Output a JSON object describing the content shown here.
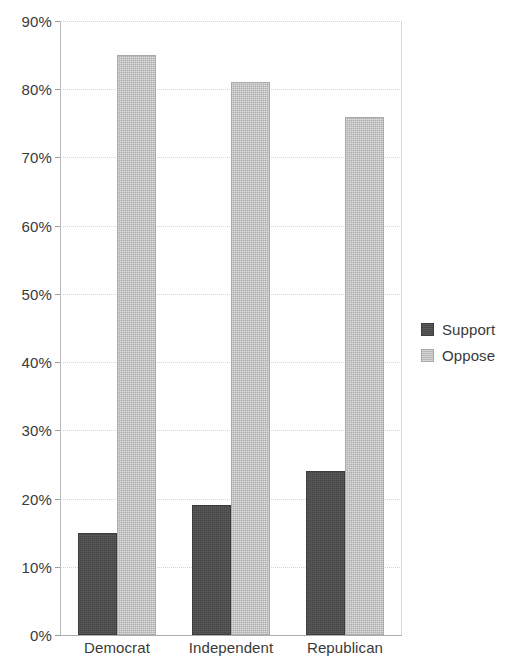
{
  "chart_data": {
    "type": "bar",
    "title": "",
    "subtitle": "",
    "xlabel": "",
    "ylabel": "",
    "categories": [
      "Democrat",
      "Independent",
      "Republican"
    ],
    "series": [
      {
        "name": "Support",
        "values": [
          15,
          19,
          24
        ],
        "color": "#4d4d4d"
      },
      {
        "name": "Oppose",
        "values": [
          85,
          81,
          76
        ],
        "color": "#c2c2c2"
      }
    ],
    "ylim": [
      0,
      90
    ],
    "ytick_values": [
      0,
      10,
      20,
      30,
      40,
      50,
      60,
      70,
      80,
      90
    ],
    "ytick_labels": [
      "0%",
      "10%",
      "20%",
      "30%",
      "40%",
      "50%",
      "60%",
      "70%",
      "80%",
      "90%"
    ],
    "value_suffix": "%",
    "grid": true,
    "grid_axis": "y",
    "legend_position": "right",
    "legend_entries": [
      "Support",
      "Oppose"
    ],
    "bar_mode": "grouped"
  },
  "legend": {
    "items": [
      {
        "label": "Support",
        "swatch": "support"
      },
      {
        "label": "Oppose",
        "swatch": "oppose"
      }
    ]
  },
  "axes": {
    "y_tick_labels": [
      "90%",
      "80%",
      "70%",
      "60%",
      "50%",
      "40%",
      "30%",
      "20%",
      "10%",
      "0%"
    ],
    "x_tick_labels": [
      "Democrat",
      "Independent",
      "Republican"
    ]
  },
  "colors": {
    "support": "#4d4d4d",
    "oppose": "#c2c2c2",
    "gridline": "#d6d6d6",
    "axis": "#aeaeae",
    "text": "#3a3a3a",
    "background": "#ffffff"
  }
}
